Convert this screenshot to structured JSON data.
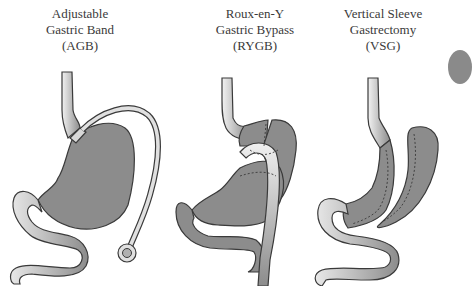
{
  "figure": {
    "panels": [
      {
        "id": "agb",
        "title_lines": [
          "Adjustable",
          "Gastric Band",
          "(AGB)"
        ]
      },
      {
        "id": "rygb",
        "title_lines": [
          "Roux-en-Y",
          "Gastric Bypass",
          "(RYGB)"
        ]
      },
      {
        "id": "vsg",
        "title_lines": [
          "Vertical Sleeve",
          "Gastrectomy",
          "(VSG)"
        ]
      }
    ],
    "colors": {
      "organ_fill": "#8c8c8c",
      "organ_stroke": "#3a3a3a",
      "tube_light": "#e0e0e0",
      "background": "#ffffff",
      "text": "#3a3a3a"
    }
  }
}
